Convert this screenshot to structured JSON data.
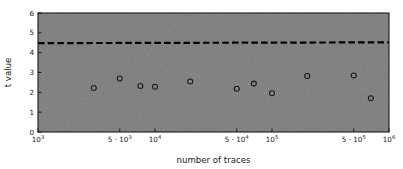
{
  "chart_data": {
    "type": "scatter",
    "title": "",
    "xlabel": "number of traces",
    "ylabel": "t value",
    "xscale": "log",
    "yscale": "linear",
    "xlim": [
      1000,
      1000000
    ],
    "ylim": [
      0,
      6
    ],
    "grid": false,
    "legend": null,
    "plot_background_color": "#7d7d7d",
    "figure_background_color": "#ffffff",
    "marker_color": "#1a1a1a",
    "marker_style": "open-circle",
    "threshold_line": {
      "label": "",
      "value": 4.5,
      "style": "dashed",
      "color": "#000000",
      "linewidth": 2.2
    },
    "xticks": [
      {
        "value": 1000,
        "label": "10",
        "exponent": "3"
      },
      {
        "value": 5000,
        "label": "5 · 10",
        "exponent": "3"
      },
      {
        "value": 10000,
        "label": "10",
        "exponent": "4"
      },
      {
        "value": 50000,
        "label": "5 · 10",
        "exponent": "4"
      },
      {
        "value": 100000,
        "label": "10",
        "exponent": "5"
      },
      {
        "value": 500000,
        "label": "5 · 10",
        "exponent": "5"
      },
      {
        "value": 1000000,
        "label": "10",
        "exponent": "6"
      }
    ],
    "yticks": [
      {
        "value": 0,
        "label": "0"
      },
      {
        "value": 1,
        "label": "1"
      },
      {
        "value": 2,
        "label": "2"
      },
      {
        "value": 3,
        "label": "3"
      },
      {
        "value": 4,
        "label": "4"
      },
      {
        "value": 5,
        "label": "5"
      },
      {
        "value": 6,
        "label": "6"
      }
    ],
    "series": [
      {
        "name": "t value",
        "x": [
          3000,
          5000,
          7500,
          10000,
          20000,
          50000,
          70000,
          100000,
          200000,
          500000,
          700000
        ],
        "y": [
          2.22,
          2.7,
          2.32,
          2.28,
          2.55,
          2.18,
          2.44,
          1.95,
          2.82,
          2.85,
          1.7
        ]
      }
    ]
  }
}
